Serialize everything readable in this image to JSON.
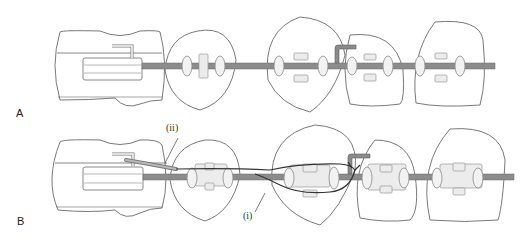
{
  "figure": {
    "panels": [
      {
        "id": "A",
        "label": "A",
        "description": "Orthodontic molar tube and brackets with continuous archwire"
      },
      {
        "id": "B",
        "label": "B",
        "description": "Archwire with auxiliary ligature threaded through bracket and tube"
      }
    ],
    "annotations": [
      {
        "id": "ii",
        "text": "(ii)"
      },
      {
        "id": "i",
        "text": "(i)"
      }
    ],
    "colors": {
      "background": "#ffffff",
      "tooth_outline": "#6a6a6a",
      "archwire": "#8c8c8c",
      "ligature": "#333333",
      "bracket": "#ececec"
    }
  }
}
